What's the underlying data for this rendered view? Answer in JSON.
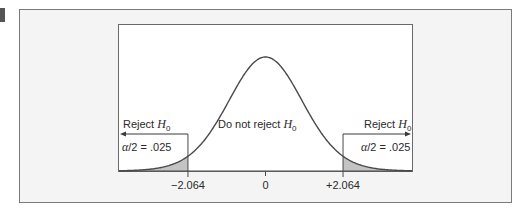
{
  "figure": {
    "type": "t-distribution two-tailed rejection regions",
    "colors": {
      "panel_bg": "#f4f4f4",
      "plot_bg": "#ffffff",
      "frame": "#7a7a7a",
      "curve": "#4a4a4a",
      "shade": "#c4c4c4",
      "text": "#2a2a2a",
      "marker": "#555555"
    }
  },
  "labels": {
    "reject_left_prefix": "Reject ",
    "reject_left_var": "H",
    "reject_left_sub": "0",
    "reject_right_prefix": "Reject ",
    "reject_right_var": "H",
    "reject_right_sub": "0",
    "do_not_reject_prefix": "Do not reject ",
    "do_not_reject_var": "H",
    "do_not_reject_sub": "0",
    "alpha_left_symbol": "α",
    "alpha_left_rest": "/2 = .025",
    "alpha_right_symbol": "α",
    "alpha_right_rest": "/2 = .025"
  },
  "chart_data": {
    "type": "area",
    "distribution": "t",
    "degrees_of_freedom_implied": 24,
    "x_range": [
      -3.9,
      3.9
    ],
    "critical_values": [
      -2.064,
      2.064
    ],
    "tail_area_each": 0.025,
    "tick_labels": [
      "−2.064",
      "0",
      "+2.064"
    ],
    "tick_values": [
      -2.064,
      0,
      2.064
    ],
    "regions": [
      {
        "name": "Reject H0",
        "from": -3.9,
        "to": -2.064,
        "shaded": true,
        "area": 0.025
      },
      {
        "name": "Do not reject H0",
        "from": -2.064,
        "to": 2.064,
        "shaded": false
      },
      {
        "name": "Reject H0",
        "from": 2.064,
        "to": 3.9,
        "shaded": true,
        "area": 0.025
      }
    ],
    "title": "",
    "xlabel": "",
    "ylabel": "",
    "grid": false,
    "legend": "none"
  }
}
